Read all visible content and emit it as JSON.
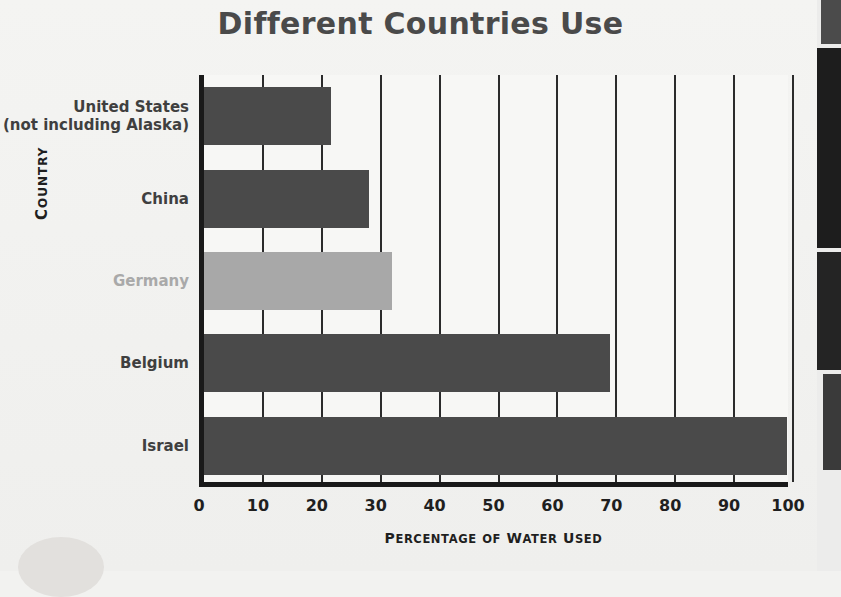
{
  "title": {
    "line1": "The Amount of Water",
    "line2": "Different Countries Use"
  },
  "colors": {
    "bar_dark": "#4a4a4a",
    "bar_light": "#a8a8a8",
    "axis": "#1a1a1a",
    "gridline": "#2b2b2b",
    "background": "#f2f2f0",
    "label_text": "#3f3f3f",
    "label_text_light": "#a9a9a9"
  },
  "chart_data": {
    "type": "bar",
    "orientation": "horizontal",
    "title": "The Amount of Water Different Countries Use",
    "xlabel": "Percentage of Water Used",
    "ylabel": "Country",
    "categories": [
      "United States (not including Alaska)",
      "China",
      "Germany",
      "Belgium",
      "Israel"
    ],
    "values": [
      21.5,
      28,
      32,
      69,
      99
    ],
    "bar_colors": [
      "#4a4a4a",
      "#4a4a4a",
      "#a8a8a8",
      "#4a4a4a",
      "#4a4a4a"
    ],
    "xlim": [
      0,
      100
    ],
    "xticks": [
      0,
      10,
      20,
      30,
      40,
      50,
      60,
      70,
      80,
      90,
      100
    ],
    "xtick_labels": [
      "0",
      "10",
      "20",
      "30",
      "40",
      "50",
      "60",
      "70",
      "80",
      "90",
      "100"
    ],
    "grid": "vertical",
    "legend": "none"
  },
  "ylabels": [
    {
      "line1": "United States",
      "line2": "(not including Alaska)",
      "style": "dark"
    },
    {
      "line1": "China",
      "line2": "",
      "style": "dark"
    },
    {
      "line1": "Germany",
      "line2": "",
      "style": "light"
    },
    {
      "line1": "Belgium",
      "line2": "",
      "style": "dark"
    },
    {
      "line1": "Israel",
      "line2": "",
      "style": "dark"
    }
  ],
  "axis_titles": {
    "y_first": "C",
    "y_rest": "OUNTRY",
    "x_words": [
      {
        "first": "P",
        "rest": "ERCENTAGE"
      },
      {
        "first": "",
        "rest": "OF"
      },
      {
        "first": "W",
        "rest": "ATER"
      },
      {
        "first": "U",
        "rest": "SED"
      }
    ]
  }
}
